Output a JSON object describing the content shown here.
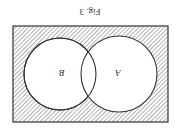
{
  "figure": {
    "caption": "Fig. 3",
    "orientation": "rotated 180°",
    "universe_shaded": true,
    "sets": [
      {
        "label": "B",
        "position": "left"
      },
      {
        "label": "A",
        "position": "right"
      }
    ],
    "colors": {
      "line": "#333333",
      "hatch": "#444444",
      "background": "#ffffff"
    }
  }
}
